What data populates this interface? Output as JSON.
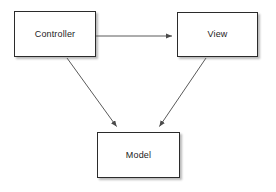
{
  "diagram": {
    "background_color": "#ffffff",
    "node_fill_color": "#ffffff",
    "node_border_color": "#2b2b2b",
    "edge_color": "#5a5a5a",
    "text_color": "#1c1c1c",
    "nodes": [
      {
        "id": "controller",
        "label": "Controller",
        "shape": "rectangle",
        "x": 14,
        "y": 11,
        "width": 82,
        "height": 46
      },
      {
        "id": "view",
        "label": "View",
        "shape": "rectangle",
        "x": 177,
        "y": 12,
        "width": 81,
        "height": 45
      },
      {
        "id": "model",
        "label": "Model",
        "shape": "rectangle",
        "x": 97,
        "y": 132,
        "width": 83,
        "height": 46
      }
    ],
    "edges": [
      {
        "id": "controller-to-view",
        "from": "controller",
        "to": "view",
        "label": "",
        "arrowhead": "filled-triangle",
        "x1": 96,
        "y1": 36,
        "x2": 176,
        "y2": 36
      },
      {
        "id": "controller-to-model",
        "from": "controller",
        "to": "model",
        "label": "",
        "arrowhead": "filled-triangle",
        "x1": 67,
        "y1": 58,
        "x2": 119,
        "y2": 131
      },
      {
        "id": "view-to-model",
        "from": "view",
        "to": "model",
        "label": "",
        "arrowhead": "filled-triangle",
        "x1": 206,
        "y1": 58,
        "x2": 157,
        "y2": 131
      }
    ]
  }
}
